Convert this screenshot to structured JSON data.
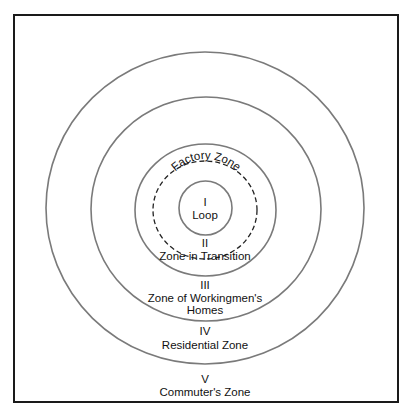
{
  "diagram": {
    "type": "concentric-zones",
    "zones": [
      {
        "numeral": "I",
        "name": "Loop"
      },
      {
        "numeral": "II",
        "name": "Zone in Transition"
      },
      {
        "numeral": "III",
        "name_line1": "Zone of Workingmen's",
        "name_line2": "Homes"
      },
      {
        "numeral": "IV",
        "name": "Residential Zone"
      },
      {
        "numeral": "V",
        "name": "Commuter's Zone"
      }
    ],
    "subzone": {
      "name": "Factory Zone"
    }
  }
}
